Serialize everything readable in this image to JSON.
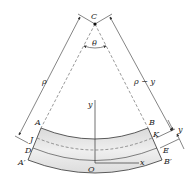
{
  "diagram": {
    "labels": {
      "center": "C",
      "angle": "θ",
      "radius": "ρ",
      "radius_minus_y": "ρ − y",
      "y_axis": "y",
      "x_axis": "x",
      "origin": "O",
      "y_dim": "y",
      "A": "A",
      "B": "B",
      "J": "J",
      "K": "K",
      "D": "D",
      "E": "E",
      "A_prime": "A′",
      "B_prime": "B′"
    },
    "colors": {
      "beam_fill": "#e6e6e6",
      "line": "#333333",
      "dashed": "#555555"
    }
  }
}
